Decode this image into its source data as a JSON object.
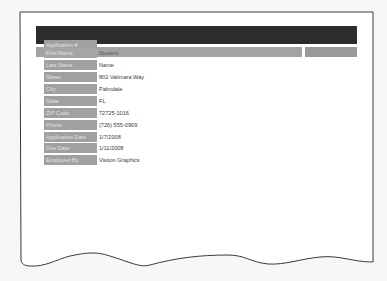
{
  "form": {
    "fields": [
      {
        "label": "Application #",
        "value": ""
      },
      {
        "label": "First Name",
        "value": "Student"
      },
      {
        "label": "Last Name",
        "value": "Name"
      },
      {
        "label": "Street",
        "value": "802 Valimara Way"
      },
      {
        "label": "City",
        "value": "Palmdale"
      },
      {
        "label": "State",
        "value": "FL"
      },
      {
        "label": "ZIP Code",
        "value": "72725-1016"
      },
      {
        "label": "Phone",
        "value": "(726) 555-0909"
      },
      {
        "label": "Application Date",
        "value": "1/7/2008"
      },
      {
        "label": "Due Date",
        "value": "1/11/2008"
      },
      {
        "label": "Employed By",
        "value": "Vistion Graphics"
      }
    ]
  },
  "colors": {
    "header_dark": "#2c2c2c",
    "header_gray": "#a3a3a3",
    "label_bg": "#a0a0a0",
    "value_text": "#3a3a3a"
  }
}
